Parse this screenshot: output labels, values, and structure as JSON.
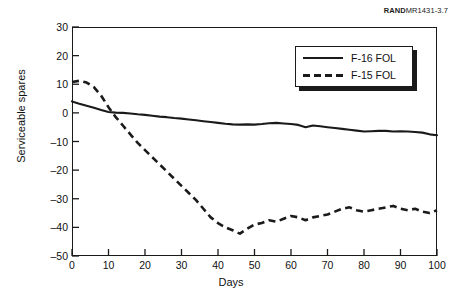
{
  "source_note": {
    "bold": "RAND",
    "rest": "MR1431-3.7"
  },
  "legend": {
    "entries": [
      {
        "label": "F-16 FOL",
        "style": "solid",
        "color": "#1a1a1a"
      },
      {
        "label": "F-15 FOL",
        "style": "dashed",
        "color": "#1a1a1a"
      }
    ]
  },
  "axes": {
    "xlabel": "Days",
    "ylabel": "Serviceable spares",
    "xticks": [
      0,
      10,
      20,
      30,
      40,
      50,
      60,
      70,
      80,
      90,
      100
    ],
    "yticks": [
      30,
      20,
      10,
      0,
      "–10",
      "–20",
      "–30",
      "–40",
      "–50"
    ]
  },
  "chart_data": {
    "type": "line",
    "title": "",
    "subtitle": "",
    "xlabel": "Days",
    "ylabel": "Serviceable spares",
    "xlim": [
      0,
      100
    ],
    "ylim": [
      -50,
      30
    ],
    "xticks": [
      0,
      10,
      20,
      30,
      40,
      50,
      60,
      70,
      80,
      90,
      100
    ],
    "yticks": [
      -50,
      -40,
      -30,
      -20,
      -10,
      0,
      10,
      20,
      30
    ],
    "grid": false,
    "legend_position": "top-right",
    "x": [
      0,
      2,
      4,
      6,
      8,
      10,
      12,
      14,
      16,
      18,
      20,
      22,
      24,
      26,
      28,
      30,
      32,
      34,
      36,
      38,
      40,
      42,
      44,
      46,
      48,
      50,
      52,
      54,
      56,
      58,
      60,
      62,
      64,
      66,
      68,
      70,
      72,
      74,
      76,
      78,
      80,
      82,
      84,
      86,
      88,
      90,
      92,
      94,
      96,
      98,
      100
    ],
    "series": [
      {
        "name": "F-16 FOL",
        "style": "solid",
        "color": "#1a1a1a",
        "values": [
          4.0,
          3.2,
          2.5,
          1.8,
          1.0,
          0.3,
          0.1,
          0.0,
          -0.2,
          -0.5,
          -0.7,
          -1.0,
          -1.3,
          -1.5,
          -1.8,
          -2.0,
          -2.3,
          -2.6,
          -2.9,
          -3.2,
          -3.5,
          -3.8,
          -4.0,
          -4.1,
          -4.0,
          -4.1,
          -3.9,
          -3.6,
          -3.5,
          -3.7,
          -3.9,
          -4.2,
          -5.0,
          -4.4,
          -4.7,
          -5.0,
          -5.3,
          -5.6,
          -5.9,
          -6.2,
          -6.5,
          -6.4,
          -6.3,
          -6.3,
          -6.5,
          -6.4,
          -6.5,
          -6.7,
          -6.9,
          -7.5,
          -7.8
        ]
      },
      {
        "name": "F-15 FOL",
        "style": "dashed",
        "color": "#1a1a1a",
        "values": [
          10.8,
          11.2,
          10.6,
          9.0,
          6.0,
          2.0,
          -1.5,
          -4.5,
          -7.5,
          -10.5,
          -13.0,
          -15.5,
          -18.0,
          -20.5,
          -23.0,
          -25.5,
          -28.0,
          -30.5,
          -33.5,
          -36.5,
          -38.5,
          -40.0,
          -41.0,
          -42.2,
          -40.5,
          -39.0,
          -38.5,
          -37.5,
          -38.0,
          -37.0,
          -36.0,
          -36.5,
          -37.5,
          -36.5,
          -36.0,
          -35.5,
          -34.5,
          -33.5,
          -33.0,
          -34.0,
          -34.5,
          -34.0,
          -33.5,
          -33.0,
          -32.5,
          -33.5,
          -34.0,
          -33.5,
          -34.5,
          -35.0,
          -34.0
        ]
      }
    ]
  }
}
